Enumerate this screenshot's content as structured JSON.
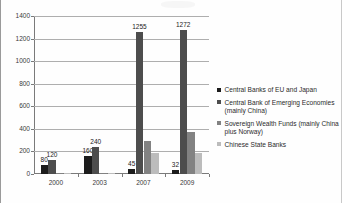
{
  "chart_data": {
    "type": "bar",
    "title": "",
    "subtitle": "",
    "xlabel": "",
    "ylabel": "",
    "categories": [
      "2000",
      "2003",
      "2007",
      "2009"
    ],
    "ylim": [
      0,
      1400
    ],
    "ytick_step": 200,
    "yticks": [
      "0",
      "200",
      "400",
      "600",
      "800",
      "1000",
      "1200",
      "1400"
    ],
    "grid": true,
    "legend_position": "right",
    "series": [
      {
        "name": "Central Banks of EU and Japan",
        "color": "#1c1c1c",
        "values": [
          80,
          160,
          45,
          32
        ],
        "labels": [
          "80",
          "160",
          "45",
          "32"
        ]
      },
      {
        "name": "Central Bank of Emerging Economies (mainly China)",
        "color": "#4d4d4d",
        "values": [
          120,
          240,
          1255,
          1272
        ],
        "labels": [
          "120",
          "240",
          "1255",
          "1272"
        ]
      },
      {
        "name": "Sovereign Wealth Funds (mainly China plus Norway)",
        "color": "#828282",
        "values": [
          3,
          4,
          290,
          370
        ],
        "labels": [
          "",
          "",
          "",
          ""
        ]
      },
      {
        "name": "Chinese State Banks",
        "color": "#bcbcbc",
        "values": [
          12,
          6,
          190,
          190
        ],
        "labels": [
          "",
          "",
          "",
          ""
        ]
      }
    ]
  },
  "legend": {
    "entries": [
      {
        "label": "Central Banks of EU and Japan"
      },
      {
        "label": "Central Bank of Emerging Economies (mainly China)"
      },
      {
        "label": "Sovereign Wealth Funds (mainly China plus Norway)"
      },
      {
        "label": "Chinese State Banks"
      }
    ]
  }
}
